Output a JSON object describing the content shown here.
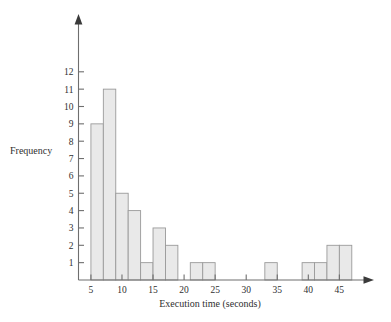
{
  "chart_data": {
    "type": "bar",
    "title": "",
    "subtitle": "",
    "xlabel": "Execution time (seconds)",
    "ylabel": "Frequency",
    "xlim": [
      3,
      48
    ],
    "ylim": [
      0,
      12.8
    ],
    "grid": false,
    "legend": null,
    "bin_width": 2,
    "xticks": [
      5,
      10,
      15,
      20,
      25,
      30,
      35,
      40,
      45
    ],
    "yticks": [
      1,
      2,
      3,
      4,
      5,
      6,
      7,
      8,
      9,
      10,
      11,
      12
    ],
    "bin_edges": [
      5,
      7,
      9,
      11,
      13,
      15,
      17,
      19,
      21,
      23,
      25,
      27,
      29,
      31,
      33,
      35,
      37,
      39,
      41,
      43,
      45,
      47
    ],
    "categories": [
      "5-7",
      "7-9",
      "9-11",
      "11-13",
      "13-15",
      "15-17",
      "17-19",
      "19-21",
      "21-23",
      "23-25",
      "25-27",
      "27-29",
      "29-31",
      "31-33",
      "33-35",
      "35-37",
      "37-39",
      "39-41",
      "41-43",
      "43-45",
      "45-47"
    ],
    "values": [
      9,
      11,
      5,
      4,
      1,
      3,
      2,
      0,
      1,
      1,
      0,
      0,
      0,
      0,
      1,
      0,
      0,
      1,
      1,
      2,
      2
    ],
    "bar_fill": "#e9e9e9",
    "bar_stroke": "#9a9a9a",
    "axis_color": "#6e6e6e"
  },
  "axes": {
    "x_title": "Execution time (seconds)",
    "y_title": "Frequency",
    "x_tick_labels": [
      "5",
      "10",
      "15",
      "20",
      "25",
      "30",
      "35",
      "40",
      "45"
    ],
    "y_tick_labels": [
      "1",
      "2",
      "3",
      "4",
      "5",
      "6",
      "7",
      "8",
      "9",
      "10",
      "11",
      "12"
    ]
  }
}
